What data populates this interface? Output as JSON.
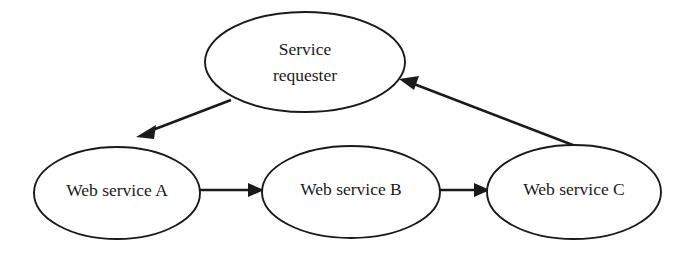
{
  "diagram": {
    "type": "flow-diagram",
    "background_color": "#ffffff",
    "stroke_color": "#1a1a1a",
    "nodes": [
      {
        "id": "service-requester",
        "shape": "ellipse",
        "label_line1": "Service",
        "label_line2": "requester",
        "label_full": "Service requester",
        "cx": 305,
        "cy": 62,
        "rx": 100,
        "ry": 50
      },
      {
        "id": "web-service-a",
        "shape": "ellipse",
        "label_line1": "Web service A",
        "label_full": "Web service A",
        "cx": 117,
        "cy": 193,
        "rx": 83,
        "ry": 46
      },
      {
        "id": "web-service-b",
        "shape": "ellipse",
        "label_line1": "Web service B",
        "label_full": "Web service B",
        "cx": 351,
        "cy": 192,
        "rx": 89,
        "ry": 46
      },
      {
        "id": "web-service-c",
        "shape": "ellipse",
        "label_line1": "Web service C",
        "label_full": "Web service C",
        "cx": 574,
        "cy": 192,
        "rx": 87,
        "ry": 47
      }
    ],
    "edges": [
      {
        "id": "edge-requester-to-a",
        "from": "service-requester",
        "to": "web-service-a",
        "direction": "down-left",
        "arrowhead": "end"
      },
      {
        "id": "edge-a-to-b",
        "from": "web-service-a",
        "to": "web-service-b",
        "direction": "right",
        "arrowhead": "end"
      },
      {
        "id": "edge-b-to-c",
        "from": "web-service-b",
        "to": "web-service-c",
        "direction": "right",
        "arrowhead": "end"
      },
      {
        "id": "edge-c-to-requester",
        "from": "web-service-c",
        "to": "service-requester",
        "direction": "up-left",
        "arrowhead": "end"
      }
    ]
  }
}
